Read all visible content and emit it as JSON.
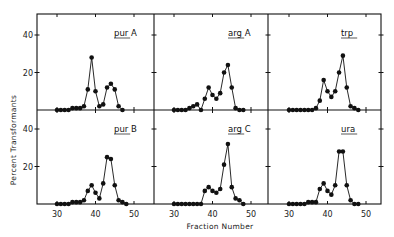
{
  "chart_data": {
    "type": "line",
    "xlabel": "Fraction Number",
    "ylabel": "Percent Transformants",
    "xlim": [
      25,
      55
    ],
    "ylim": [
      0,
      50
    ],
    "xticks": [
      30,
      40,
      50
    ],
    "yticks": [
      20,
      40
    ],
    "grid": false,
    "layout": "2 rows x 3 columns",
    "panels": [
      {
        "title": "pur A",
        "underline": "pur",
        "x": [
          30,
          31,
          32,
          33,
          34,
          35,
          36,
          37,
          38,
          39,
          40,
          41,
          42,
          43,
          44,
          45,
          46,
          47
        ],
        "values": [
          0,
          0,
          0,
          0,
          1,
          1,
          1,
          2,
          11,
          28,
          10,
          2,
          3,
          12,
          14,
          11,
          2,
          0
        ]
      },
      {
        "title": "arg A",
        "underline": "arg",
        "x": [
          30,
          31,
          32,
          33,
          34,
          35,
          36,
          37,
          38,
          39,
          40,
          41,
          42,
          43,
          44,
          45,
          46,
          47,
          48
        ],
        "values": [
          0,
          0,
          0,
          0,
          1,
          2,
          3,
          0,
          6,
          12,
          8,
          6,
          9,
          20,
          24,
          12,
          1,
          0,
          0
        ]
      },
      {
        "title": "trp",
        "underline": "trp",
        "x": [
          30,
          31,
          32,
          33,
          34,
          35,
          36,
          37,
          38,
          39,
          40,
          41,
          42,
          43,
          44,
          45,
          46,
          47,
          48
        ],
        "values": [
          0,
          0,
          0,
          0,
          0,
          0,
          0,
          1,
          5,
          16,
          10,
          7,
          10,
          20,
          29,
          12,
          2,
          1,
          0
        ]
      },
      {
        "title": "pur B",
        "underline": "pur",
        "x": [
          30,
          31,
          32,
          33,
          34,
          35,
          36,
          37,
          38,
          39,
          40,
          41,
          42,
          43,
          44,
          45,
          46,
          47,
          48
        ],
        "values": [
          0,
          0,
          0,
          0,
          1,
          1,
          1,
          2,
          7,
          10,
          6,
          3,
          11,
          25,
          24,
          10,
          2,
          1,
          0
        ]
      },
      {
        "title": "arg C",
        "underline": "arg",
        "x": [
          30,
          31,
          32,
          33,
          34,
          35,
          36,
          37,
          38,
          39,
          40,
          41,
          42,
          43,
          44,
          45,
          46,
          47,
          48
        ],
        "values": [
          0,
          0,
          0,
          0,
          0,
          0,
          0,
          0,
          7,
          9,
          7,
          6,
          8,
          21,
          32,
          9,
          3,
          2,
          0
        ]
      },
      {
        "title": "ura",
        "underline": "ura",
        "x": [
          30,
          31,
          32,
          33,
          34,
          35,
          36,
          37,
          38,
          39,
          40,
          41,
          42,
          43,
          44,
          45,
          46,
          47,
          48
        ],
        "values": [
          0,
          0,
          0,
          0,
          0,
          1,
          1,
          1,
          8,
          11,
          7,
          5,
          10,
          28,
          28,
          10,
          2,
          0,
          0
        ]
      }
    ]
  }
}
